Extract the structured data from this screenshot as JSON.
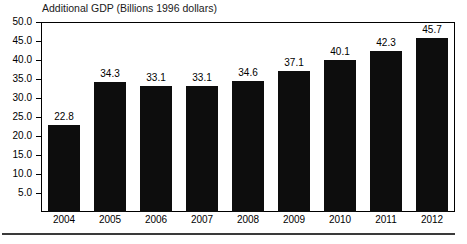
{
  "chart_data": {
    "type": "bar",
    "title": "Additional GDP (Billions 1996 dollars)",
    "xlabel": "",
    "ylabel": "",
    "categories": [
      "2004",
      "2005",
      "2006",
      "2007",
      "2008",
      "2009",
      "2010",
      "2011",
      "2012"
    ],
    "values": [
      22.8,
      34.3,
      33.1,
      33.1,
      34.6,
      37.1,
      40.1,
      42.3,
      45.7
    ],
    "value_labels": [
      "22.8",
      "34.3",
      "33.1",
      "33.1",
      "34.6",
      "37.1",
      "40.1",
      "42.3",
      "45.7"
    ],
    "ylim": [
      0,
      50
    ],
    "ytick_labels": [
      "50.0",
      "45.0",
      "40.0",
      "35.0",
      "30.0",
      "25.0",
      "20.0",
      "15.0",
      "10.0",
      "5.0"
    ],
    "ytick_values": [
      50.0,
      45.0,
      40.0,
      35.0,
      30.0,
      25.0,
      20.0,
      15.0,
      10.0,
      5.0
    ],
    "grid": false,
    "legend": null,
    "bar_color": "#0d0d0d",
    "frame_color": "#000000",
    "background": "#ffffff"
  }
}
